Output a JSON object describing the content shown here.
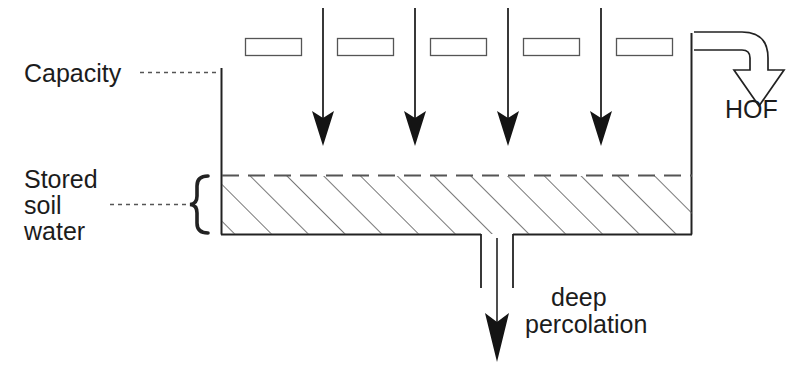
{
  "diagram": {
    "labels": {
      "capacity": "Capacity",
      "stored_line1": "Stored",
      "stored_line2": "soil",
      "stored_line3": "water",
      "hof": "HOF",
      "percolation_line1": "deep",
      "percolation_line2": "percolation"
    },
    "icons": {
      "rain_arrow": "down-arrow-icon",
      "runoff_arrow": "curved-down-arrow-icon",
      "percolation_arrow": "down-arrow-icon",
      "brace": "curly-brace-icon",
      "leader_capacity": "dotted-leader-icon",
      "leader_stored": "dotted-leader-icon"
    },
    "colors": {
      "line": "#222222",
      "hatch": "#555555",
      "text": "#1c1c1c",
      "background": "#ffffff"
    },
    "geometry": {
      "tank_left_x": 221,
      "tank_right_x": 692,
      "tank_top_y": 68,
      "tank_bottom_y": 234,
      "water_level_y": 175,
      "right_wall_top_y": 33,
      "rain_arrow_count": 4,
      "canopy_box_count": 5
    },
    "canopy_boxes": [
      {
        "x": 245,
        "y": 38,
        "w": 56,
        "h": 17
      },
      {
        "x": 337,
        "y": 38,
        "w": 56,
        "h": 17
      },
      {
        "x": 430,
        "y": 38,
        "w": 56,
        "h": 17
      },
      {
        "x": 523,
        "y": 38,
        "w": 56,
        "h": 17
      },
      {
        "x": 616,
        "y": 38,
        "w": 56,
        "h": 17
      }
    ],
    "rain_arrows": [
      {
        "x": 323,
        "y_top": 8,
        "y_tip": 146
      },
      {
        "x": 415,
        "y_top": 8,
        "y_tip": 146
      },
      {
        "x": 508,
        "y_top": 8,
        "y_tip": 146
      },
      {
        "x": 601,
        "y_top": 8,
        "y_tip": 146
      }
    ]
  }
}
